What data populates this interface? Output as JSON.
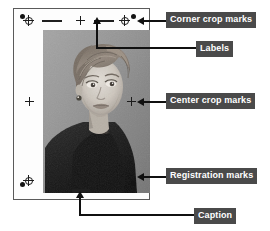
{
  "callouts": [
    {
      "id": "corner-crop-marks",
      "label": "Corner crop marks"
    },
    {
      "id": "labels",
      "label": "Labels"
    },
    {
      "id": "center-crop-marks",
      "label": "Center crop marks"
    },
    {
      "id": "registration-marks",
      "label": "Registration marks"
    },
    {
      "id": "caption",
      "label": "Caption"
    }
  ],
  "colors": {
    "callout_background": "#4a4a4a",
    "callout_text": "#ffffff",
    "mark_ink": "#1c1c1c",
    "leader_line": "#101010",
    "sheet": "#fdfdfd",
    "sheet_border": "#5a5a5a"
  }
}
